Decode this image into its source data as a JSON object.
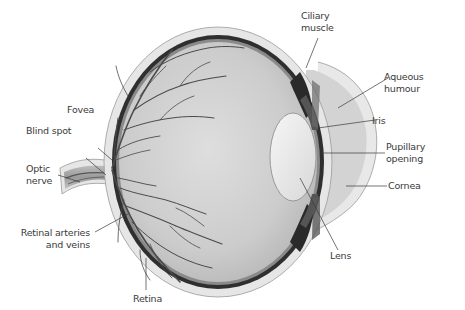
{
  "diagram": {
    "colors": {
      "background": "#ffffff",
      "sclera_outer": "#e4e4e4",
      "choroid": "#2e2e2e",
      "vitreous": "#c9c9c9",
      "lens": "#ececec",
      "aqueous": "#d2d2d2",
      "vessels": "#4a4a4a",
      "leader_lines": "#3a3a3a",
      "label_text": "#3a3a3a"
    },
    "labels": {
      "ciliary_muscle": {
        "line1": "Ciliary",
        "line2": "muscle"
      },
      "aqueous_humour": {
        "line1": "Aqueous",
        "line2": "humour"
      },
      "iris": "Iris",
      "pupillary_opening": {
        "line1": "Pupillary",
        "line2": "opening"
      },
      "cornea": "Cornea",
      "lens": "Lens",
      "fovea": "Fovea",
      "blind_spot": "Blind spot",
      "optic_nerve": {
        "line1": "Optic",
        "line2": "nerve"
      },
      "retinal_vessels": {
        "line1": "Retinal arteries",
        "line2": "and veins"
      },
      "retina": "Retina"
    }
  }
}
